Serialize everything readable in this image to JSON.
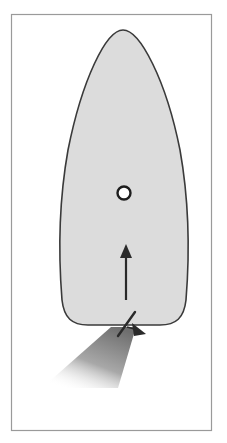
{
  "diagram": {
    "colors": {
      "background": "#ffffff",
      "frame": "#9a9a9a",
      "hull_fill": "#dcdcdc",
      "hull_outline": "#3a3a3a",
      "arrow": "#2a2a2a",
      "pivot_point_ring": "#1e1e1e",
      "pivot_point_fill": "#ffffff",
      "wake_start": "#6e6e6e",
      "wake_end": "#ffffff"
    },
    "elements": [
      {
        "name": "hull",
        "label": ""
      },
      {
        "name": "pivot-point",
        "label": ""
      },
      {
        "name": "direction-arrow",
        "label": ""
      },
      {
        "name": "rudder",
        "label": ""
      },
      {
        "name": "thrust-arrowhead",
        "label": ""
      },
      {
        "name": "prop-wash",
        "label": ""
      }
    ]
  }
}
